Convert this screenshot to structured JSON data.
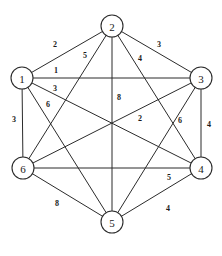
{
  "figure": {
    "background_color": "#ffffff",
    "line_color": "#2b2b2b",
    "width": 222,
    "height": 256
  },
  "chart_data": {
    "type": "diagram",
    "diagram_kind": "weighted-undirected-graph",
    "title": "",
    "node_count": 6,
    "edge_count": 15,
    "nodes": [
      {
        "id": "1",
        "label": "1",
        "x": 22,
        "y": 78,
        "r": 11
      },
      {
        "id": "2",
        "label": "2",
        "x": 112,
        "y": 26,
        "r": 11
      },
      {
        "id": "3",
        "label": "3",
        "x": 201,
        "y": 78,
        "r": 11
      },
      {
        "id": "4",
        "label": "4",
        "x": 201,
        "y": 168,
        "r": 11
      },
      {
        "id": "5",
        "label": "5",
        "x": 112,
        "y": 222,
        "r": 11
      },
      {
        "id": "6",
        "label": "6",
        "x": 23,
        "y": 168,
        "r": 11
      }
    ],
    "edges": [
      {
        "from": "1",
        "to": "2",
        "weight": "2",
        "label_x": 55,
        "label_y": 44
      },
      {
        "from": "2",
        "to": "3",
        "weight": "3",
        "label_x": 159,
        "label_y": 44
      },
      {
        "from": "1",
        "to": "3",
        "weight": "1",
        "label_x": 56,
        "label_y": 70
      },
      {
        "from": "2",
        "to": "6",
        "weight": "5",
        "label_x": 85,
        "label_y": 55
      },
      {
        "from": "2",
        "to": "4",
        "weight": "4",
        "label_x": 140,
        "label_y": 58
      },
      {
        "from": "1",
        "to": "4",
        "weight": "3",
        "label_x": 55,
        "label_y": 88
      },
      {
        "from": "1",
        "to": "5",
        "weight": "6",
        "label_x": 48,
        "label_y": 104
      },
      {
        "from": "1",
        "to": "6",
        "weight": "3",
        "label_x": 14,
        "label_y": 119
      },
      {
        "from": "2",
        "to": "5",
        "weight": "8",
        "label_x": 119,
        "label_y": 97
      },
      {
        "from": "3",
        "to": "6",
        "weight": "2",
        "label_x": 140,
        "label_y": 118
      },
      {
        "from": "3",
        "to": "5",
        "weight": "6",
        "label_x": 180,
        "label_y": 120
      },
      {
        "from": "3",
        "to": "4",
        "weight": "4",
        "label_x": 209,
        "label_y": 124
      },
      {
        "from": "4",
        "to": "6",
        "weight": "5",
        "label_x": 169,
        "label_y": 177
      },
      {
        "from": "5",
        "to": "6",
        "weight": "8",
        "label_x": 57,
        "label_y": 203
      },
      {
        "from": "4",
        "to": "5",
        "weight": "4",
        "label_x": 168,
        "label_y": 208
      }
    ],
    "weights_by_pair": {
      "1-2": "2",
      "1-3": "1",
      "1-4": "3",
      "1-5": "6",
      "1-6": "3",
      "2-3": "3",
      "2-4": "4",
      "2-5": "8",
      "2-6": "5",
      "3-4": "4",
      "3-5": "6",
      "3-6": "2",
      "4-5": "4",
      "4-6": "5",
      "5-6": "8"
    }
  }
}
